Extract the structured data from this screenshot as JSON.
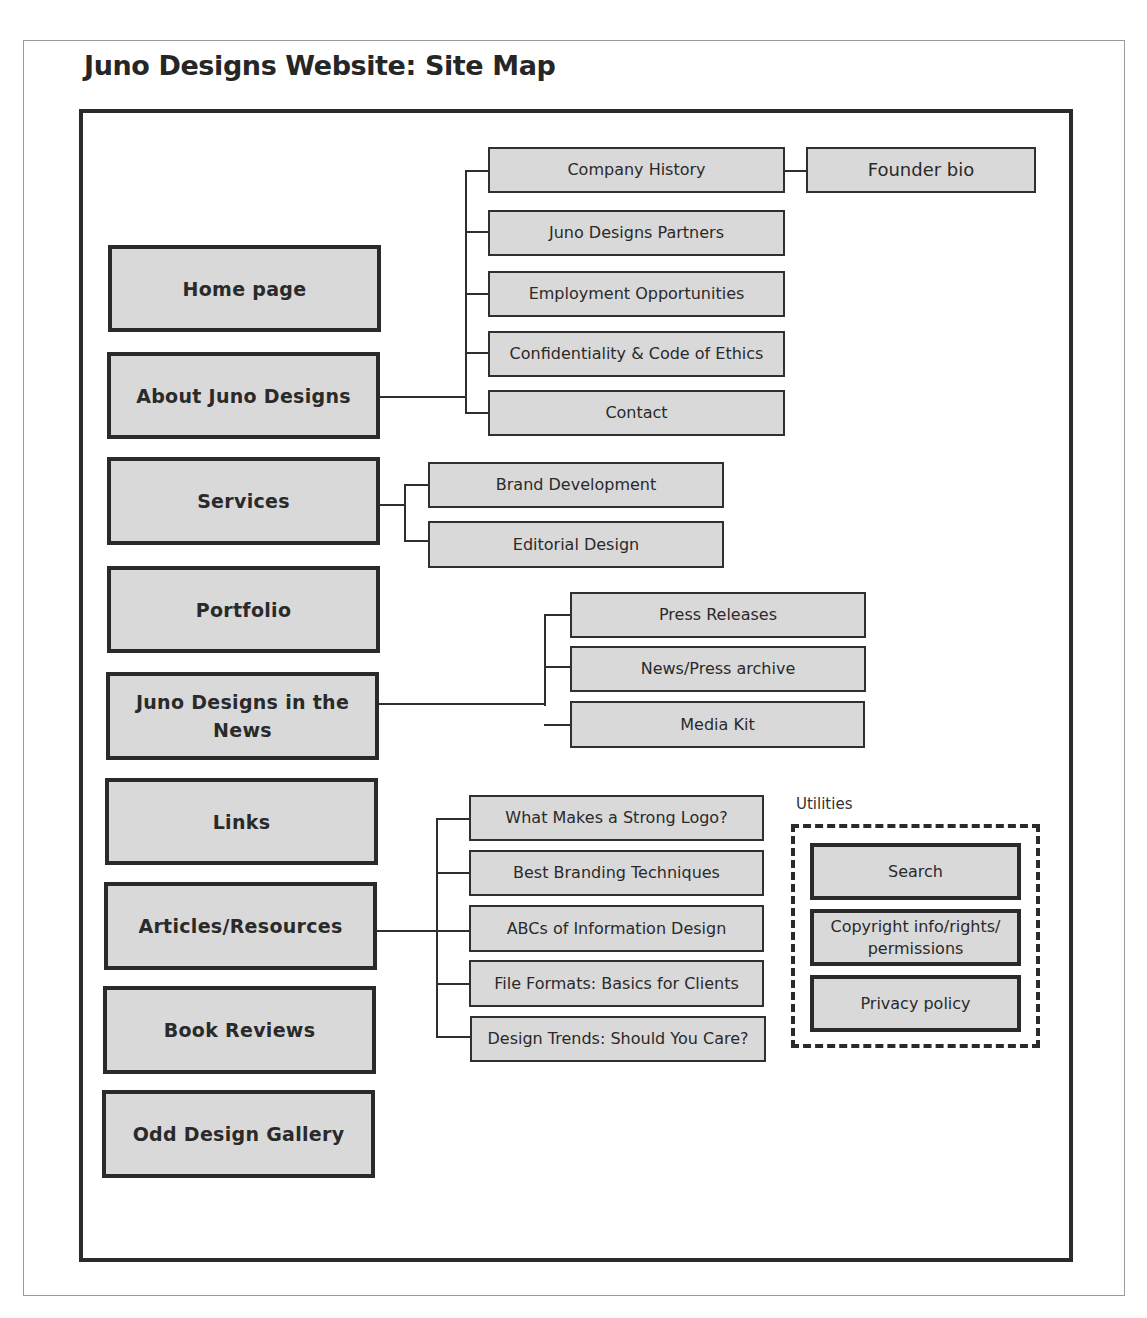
{
  "title": "Juno Designs Website: Site Map",
  "primary_pages": [
    {
      "label": "Home page"
    },
    {
      "label": "About Juno Designs"
    },
    {
      "label": "Services"
    },
    {
      "label": "Portfolio"
    },
    {
      "label": "Juno Designs in the News"
    },
    {
      "label": "Links"
    },
    {
      "label": "Articles/Resources"
    },
    {
      "label": "Book Reviews"
    },
    {
      "label": "Odd Design Gallery"
    }
  ],
  "about_children": [
    {
      "label": "Company History"
    },
    {
      "label": "Juno Designs Partners"
    },
    {
      "label": "Employment Opportunities"
    },
    {
      "label": "Confidentiality & Code of Ethics"
    },
    {
      "label": "Contact"
    }
  ],
  "company_history_children": [
    {
      "label": "Founder bio"
    }
  ],
  "services_children": [
    {
      "label": "Brand Development"
    },
    {
      "label": "Editorial Design"
    }
  ],
  "news_children": [
    {
      "label": "Press Releases"
    },
    {
      "label": "News/Press archive"
    },
    {
      "label": "Media Kit"
    }
  ],
  "articles_children": [
    {
      "label": "What Makes a Strong Logo?"
    },
    {
      "label": "Best Branding Techniques"
    },
    {
      "label": "ABCs of Information Design"
    },
    {
      "label": "File Formats: Basics for Clients"
    },
    {
      "label": "Design Trends: Should You Care?"
    }
  ],
  "utilities": {
    "label": "Utilities",
    "items": [
      {
        "label": "Search"
      },
      {
        "label": "Copyright info/rights/ permissions"
      },
      {
        "label": "Privacy policy"
      }
    ]
  },
  "colors": {
    "box_fill": "#d9d9d9",
    "line": "#2e2e2e",
    "border": "#2a2a2a"
  }
}
